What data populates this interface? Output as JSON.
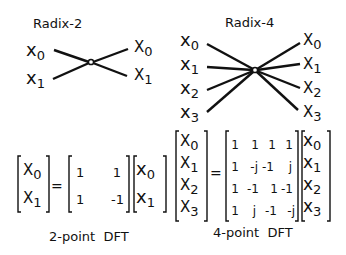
{
  "radix2": {
    "title": "Radix-2",
    "inputs": [
      "x",
      "x"
    ],
    "input_subs": [
      "0",
      "1"
    ],
    "outputs": [
      "X",
      "X"
    ],
    "output_subs": [
      "0",
      "1"
    ]
  },
  "radix4": {
    "title": "Radix-4",
    "inputs": [
      "x",
      "x",
      "x",
      "x"
    ],
    "input_subs": [
      "0",
      "1",
      "2",
      "3"
    ],
    "outputs": [
      "X",
      "X",
      "X",
      "X"
    ],
    "output_subs": [
      "0",
      "1",
      "2",
      "3"
    ]
  },
  "dft2": {
    "lhs": [
      [
        "X",
        "0"
      ],
      [
        "X",
        "1"
      ]
    ],
    "equals": "=",
    "matrix": [
      [
        "1",
        "1"
      ],
      [
        "1",
        "-1"
      ]
    ],
    "rhs": [
      [
        "x",
        "0"
      ],
      [
        "x",
        "1"
      ]
    ],
    "caption": "2-point  DFT"
  },
  "dft4": {
    "lhs": [
      [
        "X",
        "0"
      ],
      [
        "X",
        "1"
      ],
      [
        "X",
        "2"
      ],
      [
        "X",
        "3"
      ]
    ],
    "equals": "=",
    "matrix": [
      [
        "1",
        "1",
        "1",
        "1"
      ],
      [
        "1",
        "-j",
        "-1",
        "j"
      ],
      [
        "1",
        "-1",
        "1",
        "-1"
      ],
      [
        "1",
        "j",
        "-1",
        "-j"
      ]
    ],
    "rhs": [
      [
        "x",
        "0"
      ],
      [
        "x",
        "1"
      ],
      [
        "x",
        "2"
      ],
      [
        "x",
        "3"
      ]
    ],
    "caption": "4-point  DFT"
  }
}
